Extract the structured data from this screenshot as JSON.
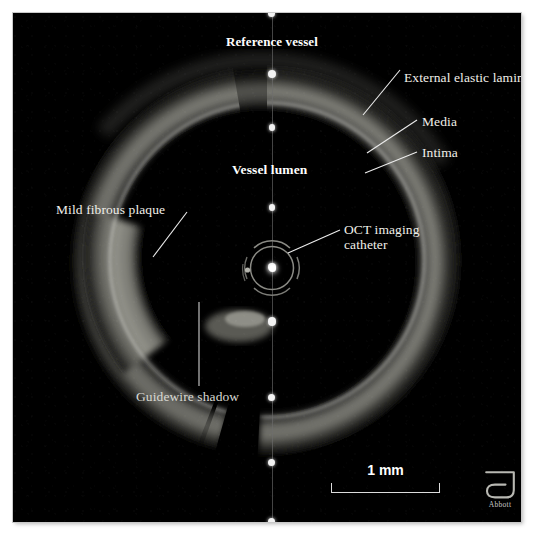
{
  "image": {
    "modality": "OCT",
    "description": "Intravascular optical coherence tomography cross-section of a coronary artery",
    "background_color": "#000000",
    "mount_color": "#ffffff",
    "annotation_color": "#f0efe9"
  },
  "annotations": [
    {
      "id": "reference-vessel",
      "label": "Reference vessel",
      "bold": true,
      "size": 13
    },
    {
      "id": "external-elastic-lamina",
      "label": "External elastic lamina",
      "bold": false,
      "size": 13
    },
    {
      "id": "media",
      "label": "Media",
      "bold": false,
      "size": 13
    },
    {
      "id": "intima",
      "label": "Intima",
      "bold": false,
      "size": 13
    },
    {
      "id": "vessel-lumen",
      "label": "Vessel lumen",
      "bold": true,
      "size": 13
    },
    {
      "id": "mild-fibrous-plaque",
      "label": "Mild fibrous plaque",
      "bold": false,
      "size": 13
    },
    {
      "id": "oct-imaging-catheter",
      "label": "OCT imaging",
      "label2": "catheter",
      "bold": false,
      "size": 13
    },
    {
      "id": "guidewire-shadow",
      "label": "Guidewire shadow",
      "bold": false,
      "size": 13
    }
  ],
  "labels": {
    "reference_vessel": "Reference vessel",
    "external_elastic_lamina": "External elastic lamina",
    "media": "Media",
    "intima": "Intima",
    "vessel_lumen": "Vessel lumen",
    "mild_fibrous_plaque": "Mild fibrous plaque",
    "oct_imaging_catheter_line1": "OCT imaging",
    "oct_imaging_catheter_line2": "catheter",
    "guidewire_shadow": "Guidewire shadow"
  },
  "scale_bar": {
    "caption": "1 mm",
    "length_px": 109,
    "value": 1,
    "unit": "mm"
  },
  "logo": {
    "name": "abbott-logo",
    "wordmark": "Abbott",
    "color": "#c9c9c9"
  },
  "measurement_axis": {
    "name": "measurement-axis",
    "orientation": "vertical",
    "tick_count": 9,
    "tick_y_positions": [
      13,
      73,
      126,
      206,
      266,
      320,
      396,
      461,
      520
    ],
    "x_position": 272
  }
}
